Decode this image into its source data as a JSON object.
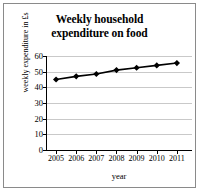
{
  "chart_data": {
    "type": "line",
    "title": "Weekly household expenditure on food",
    "title_lines": [
      "Weekly household",
      "expenditure on food"
    ],
    "xlabel": "year",
    "ylabel": "weekly expenditure in £s",
    "categories": [
      "2005",
      "2006",
      "2007",
      "2008",
      "2009",
      "2010",
      "2011"
    ],
    "x": [
      2005,
      2006,
      2007,
      2008,
      2009,
      2010,
      2011
    ],
    "values": [
      45,
      47,
      48.5,
      51,
      52.5,
      54,
      55.5
    ],
    "series": [
      {
        "name": "weekly expenditure on food",
        "values": [
          45,
          47,
          48.5,
          51,
          52.5,
          54,
          55.5
        ]
      }
    ],
    "ylim": [
      0,
      60
    ],
    "yticks": [
      0,
      10,
      20,
      30,
      40,
      50,
      60
    ],
    "ytick_labels": [
      "0",
      "10",
      "20",
      "30",
      "40",
      "50",
      "60"
    ],
    "xlim": [
      2004.5,
      2011.75
    ],
    "grid": true,
    "grid_axis": "y",
    "legend": false,
    "marker": "diamond",
    "line_color": "#000000",
    "marker_color": "#000000",
    "grid_color": "#c9c9c9",
    "axis_color": "#000000",
    "background_color": "#ffffff",
    "border_color": "#8a8a8a"
  }
}
